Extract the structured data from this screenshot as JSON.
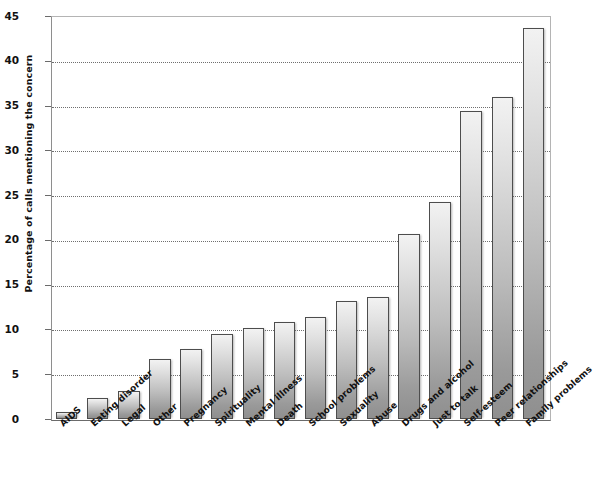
{
  "chart_data": {
    "type": "bar",
    "title": "",
    "xlabel": "",
    "ylabel": "Percentage of calls mentioning the concern",
    "ylim": [
      0,
      45
    ],
    "ytick_values": [
      0,
      5,
      10,
      15,
      20,
      25,
      30,
      35,
      40,
      45
    ],
    "ytick_labels": [
      "0",
      "5",
      "10",
      "15",
      "20",
      "25",
      "30",
      "35",
      "40",
      "45"
    ],
    "grid": true,
    "grid_axis": "y",
    "legend": "none",
    "bar_fill_top": "#f2f2f2",
    "bar_fill_bottom": "#8f8f8f",
    "bar_outline": "#4d4d4d",
    "categories": [
      "AIDS",
      "Eating disorder",
      "Legal",
      "Other",
      "Pregnancy",
      "Spirituality",
      "Mental illness",
      "Death",
      "School problems",
      "Sexuality",
      "Abuse",
      "Drugs and alcohol",
      "Just to talk",
      "Self-esteem",
      "Peer relationships",
      "Family problems"
    ],
    "values": [
      0.8,
      2.3,
      3.1,
      6.7,
      7.8,
      9.5,
      10.2,
      10.8,
      11.4,
      13.2,
      13.6,
      20.7,
      24.2,
      34.4,
      36.0,
      43.7
    ]
  }
}
